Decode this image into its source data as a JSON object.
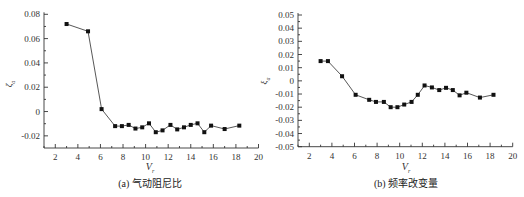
{
  "chart_data": [
    {
      "type": "line",
      "title": "",
      "caption": "(a) 气动阻尼比",
      "xlabel": "Vr",
      "ylabel": "ζa",
      "xlim": [
        1,
        20
      ],
      "ylim": [
        -0.03,
        0.08
      ],
      "xticks": [
        2,
        4,
        6,
        8,
        10,
        12,
        14,
        16,
        18,
        20
      ],
      "yticks": [
        -0.02,
        0,
        0.02,
        0.04,
        0.06,
        0.08
      ],
      "ytick_labels": [
        "-0.02",
        "0",
        "0.02",
        "0.04",
        "0.06",
        "0.08"
      ],
      "grid": false,
      "marker": "square",
      "series": [
        {
          "name": "aerodynamic damping ratio",
          "x": [
            3.0,
            4.9,
            6.1,
            7.3,
            7.9,
            8.5,
            9.1,
            9.7,
            10.3,
            10.9,
            11.5,
            12.2,
            12.8,
            13.4,
            14.0,
            14.6,
            15.2,
            15.8,
            17.0,
            18.3
          ],
          "y": [
            0.072,
            0.066,
            0.002,
            -0.012,
            -0.012,
            -0.011,
            -0.014,
            -0.013,
            -0.0097,
            -0.017,
            -0.0155,
            -0.011,
            -0.0147,
            -0.013,
            -0.011,
            -0.0097,
            -0.017,
            -0.0116,
            -0.0144,
            -0.0116
          ]
        }
      ]
    },
    {
      "type": "line",
      "title": "",
      "caption": "(b) 频率改变量",
      "xlabel": "Vr",
      "ylabel": "ξa",
      "xlim": [
        1,
        20
      ],
      "ylim": [
        -0.05,
        0.05
      ],
      "xticks": [
        2,
        4,
        6,
        8,
        10,
        12,
        14,
        16,
        18,
        20
      ],
      "yticks": [
        -0.05,
        -0.04,
        -0.03,
        -0.02,
        -0.01,
        0,
        0.01,
        0.02,
        0.03,
        0.04,
        0.05
      ],
      "ytick_labels": [
        "-0.05",
        "-0.04",
        "-0.03",
        "-0.02",
        "-0.01",
        "0",
        "0.01",
        "0.02",
        "0.03",
        "0.04",
        "0.05"
      ],
      "grid": false,
      "marker": "square",
      "series": [
        {
          "name": "frequency change",
          "x": [
            3.0,
            3.65,
            4.9,
            6.1,
            7.3,
            7.9,
            8.6,
            9.2,
            9.8,
            10.4,
            11.05,
            11.6,
            12.2,
            12.85,
            13.5,
            14.1,
            14.7,
            15.3,
            15.9,
            17.1,
            18.3
          ],
          "y": [
            0.015,
            0.015,
            0.0035,
            -0.0106,
            -0.0144,
            -0.016,
            -0.016,
            -0.02,
            -0.02,
            -0.018,
            -0.016,
            -0.0106,
            -0.0035,
            -0.005,
            -0.007,
            -0.0053,
            -0.007,
            -0.011,
            -0.009,
            -0.0127,
            -0.0106
          ]
        }
      ]
    }
  ],
  "plots": {
    "left": {
      "caption": "(a) 气动阻尼比",
      "ylabel_main": "ζ",
      "ylabel_sub": "a",
      "xlabel_main": "V",
      "xlabel_sub": "r"
    },
    "right": {
      "caption": "(b) 频率改变量",
      "ylabel_main": "ξ",
      "ylabel_sub": "a",
      "xlabel_main": "V",
      "xlabel_sub": "r"
    }
  }
}
